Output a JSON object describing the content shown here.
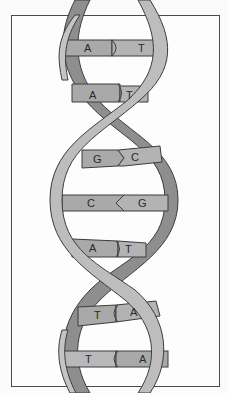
{
  "figure": {
    "type": "DNA double helix diagram",
    "colors": {
      "strand_light": "#b9b9b9",
      "strand_dark": "#8e8e8e",
      "base_fill": "#a9a9a9",
      "outline": "#3c3c3c",
      "frame": "#4a4a4a"
    }
  },
  "base_pairs": [
    {
      "left": "A",
      "right": "T"
    },
    {
      "left": "A",
      "right": "T"
    },
    {
      "left": "G",
      "right": "C"
    },
    {
      "left": "C",
      "right": "G"
    },
    {
      "left": "A",
      "right": "T"
    },
    {
      "left": "T",
      "right": "A"
    },
    {
      "left": "T",
      "right": "A"
    }
  ]
}
